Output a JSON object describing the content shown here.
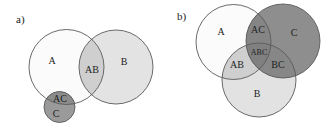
{
  "panels": [
    {
      "tag": "a)",
      "circles": {
        "A": {
          "label": "A",
          "cx": 66.5,
          "cy": 67,
          "r": 37.5,
          "fill": "#fbfbfb"
        },
        "B": {
          "label": "B",
          "cx": 116,
          "cy": 67,
          "r": 37,
          "fill": "#e3e3e3"
        },
        "C": {
          "label": "C",
          "cx": 59.5,
          "cy": 107,
          "r": 15.5,
          "fill": "#9a9a9a"
        }
      },
      "regions": {
        "A": "A",
        "AB": "AB",
        "B": "B",
        "AC": "AC",
        "C": "C"
      },
      "colors": {
        "AB": "#cfcfcf",
        "AC": "#8c8c8c",
        "stroke": "#5a5a5a"
      }
    },
    {
      "tag": "b)",
      "circles": {
        "A": {
          "label": "A",
          "cx": 233.5,
          "cy": 42,
          "r": 37.5,
          "fill": "#fbfbfb"
        },
        "C": {
          "label": "C",
          "cx": 283,
          "cy": 41,
          "r": 37,
          "fill": "#8e8e8e"
        },
        "B": {
          "label": "B",
          "cx": 259,
          "cy": 80,
          "r": 37,
          "fill": "#e2e2e2"
        }
      },
      "regions": {
        "A": "A",
        "AC": "AC",
        "C": "C",
        "ABC": "ABC",
        "AB": "AB",
        "BC": "BC",
        "B": "B"
      },
      "colors": {
        "AB": "#cfcfcf",
        "AC": "#858585",
        "BC": "#878787",
        "ABC": "#808080",
        "stroke": "#5a5a5a"
      }
    }
  ]
}
